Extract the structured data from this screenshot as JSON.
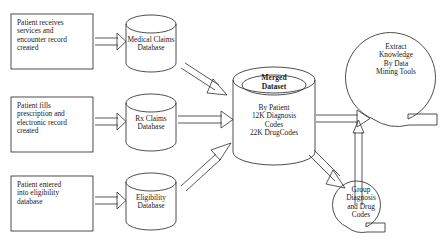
{
  "diagram": {
    "background_color": "#ffffff",
    "stroke_color": "#3a3a3a",
    "text_color": "#1a1a1a",
    "process_boxes": [
      {
        "id": "encounter",
        "label": "Patient receives\nservices and\nencounter record\ncreated"
      },
      {
        "id": "prescription",
        "label": "Patient fills\nprescription and\nelectronic record\ncreated"
      },
      {
        "id": "eligibility",
        "label": "Patient entered\ninto eligibility\ndatabase"
      }
    ],
    "databases": [
      {
        "id": "medical-claims",
        "label": "Medical Claims\nDatabase"
      },
      {
        "id": "rx-claims",
        "label": "Rx Claims\nDatabase"
      },
      {
        "id": "eligibility-db",
        "label": "Eligibility\nDatabase"
      }
    ],
    "merged": {
      "title": "Merged\nDataset",
      "body": "By Patient\n12K Diagnosis\nCodes\n22K DrugCodes"
    },
    "circles": [
      {
        "id": "extract",
        "label": "Extract\nKnowledge\nBy Data\nMining Tools"
      },
      {
        "id": "group",
        "label": "Group\nDiagnosis\nand Drug\nCodes"
      }
    ]
  }
}
